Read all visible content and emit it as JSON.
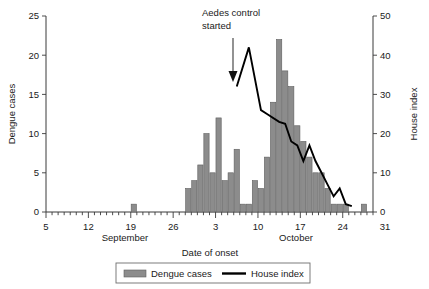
{
  "chart_data": {
    "type": "bar",
    "title": "",
    "xlabel": "Date of onset",
    "ylabel": "Dengue cases",
    "y2label": "House index",
    "ylim": [
      0,
      25
    ],
    "y2lim": [
      0,
      50
    ],
    "xlim_day_index": [
      0,
      54
    ],
    "grid": false,
    "legend_position": "bottom",
    "y_ticks": [
      "0",
      "5",
      "10",
      "15",
      "20",
      "25"
    ],
    "y_tick_values": [
      0,
      5,
      10,
      15,
      20,
      25
    ],
    "y2_ticks": [
      "0",
      "10",
      "20",
      "30",
      "40",
      "50"
    ],
    "y2_tick_values": [
      0,
      10,
      20,
      30,
      40,
      50
    ],
    "x_ticks": [
      "5",
      "12",
      "19",
      "26",
      "3",
      "10",
      "17",
      "24",
      "31"
    ],
    "x_tick_day_index": [
      0,
      7,
      14,
      21,
      28,
      35,
      42,
      49,
      56
    ],
    "month_labels": [
      {
        "text": "September",
        "day_index": 13
      },
      {
        "text": "October",
        "day_index": 41
      }
    ],
    "annotations": [
      {
        "text_line1": "Aedes control",
        "text_line2": "started",
        "arrow_day_index": 31,
        "arrow_tip_value_y2": 32
      }
    ],
    "legend": [
      {
        "label": "Dengue cases",
        "marker": "bar",
        "color": "#8c8c8c"
      },
      {
        "label": "House index",
        "marker": "line",
        "color": "#000000"
      }
    ],
    "categories_day_index": [
      0,
      1,
      2,
      3,
      4,
      5,
      6,
      7,
      8,
      9,
      10,
      11,
      12,
      13,
      14,
      15,
      16,
      17,
      18,
      19,
      20,
      21,
      22,
      23,
      24,
      25,
      26,
      27,
      28,
      29,
      30,
      31,
      32,
      33,
      34,
      35,
      36,
      37,
      38,
      39,
      40,
      41,
      42,
      43,
      44,
      45,
      46,
      47,
      48,
      49,
      50,
      51,
      52,
      53
    ],
    "date_labels": [
      "Sep 5",
      "Sep 6",
      "Sep 7",
      "Sep 8",
      "Sep 9",
      "Sep 10",
      "Sep 11",
      "Sep 12",
      "Sep 13",
      "Sep 14",
      "Sep 15",
      "Sep 16",
      "Sep 17",
      "Sep 18",
      "Sep 19",
      "Sep 20",
      "Sep 21",
      "Sep 22",
      "Sep 23",
      "Sep 24",
      "Sep 25",
      "Sep 26",
      "Sep 27",
      "Sep 28",
      "Sep 29",
      "Sep 30",
      "Oct 1",
      "Oct 2",
      "Oct 3",
      "Oct 4",
      "Oct 5",
      "Oct 6",
      "Oct 7",
      "Oct 8",
      "Oct 9",
      "Oct 10",
      "Oct 11",
      "Oct 12",
      "Oct 13",
      "Oct 14",
      "Oct 15",
      "Oct 16",
      "Oct 17",
      "Oct 18",
      "Oct 19",
      "Oct 20",
      "Oct 21",
      "Oct 22",
      "Oct 23",
      "Oct 24",
      "Oct 25",
      "Oct 26",
      "Oct 27",
      "Oct 28"
    ],
    "values": [
      0,
      0,
      0,
      0,
      0,
      0,
      0,
      0,
      0,
      0,
      0,
      0,
      0,
      0,
      1,
      0,
      0,
      0,
      0,
      0,
      0,
      0,
      0,
      3,
      4,
      6,
      10,
      5,
      12,
      4,
      5,
      8,
      1,
      1,
      4,
      3,
      7,
      14,
      22,
      18,
      16,
      11,
      9,
      7,
      5,
      5,
      3,
      1,
      1,
      1,
      0,
      0,
      1,
      0
    ],
    "series": [
      {
        "name": "Dengue cases",
        "axis": "left",
        "type": "bar",
        "values": [
          0,
          0,
          0,
          0,
          0,
          0,
          0,
          0,
          0,
          0,
          0,
          0,
          0,
          0,
          1,
          0,
          0,
          0,
          0,
          0,
          0,
          0,
          0,
          3,
          4,
          6,
          10,
          5,
          12,
          4,
          5,
          8,
          1,
          1,
          4,
          3,
          7,
          14,
          22,
          18,
          16,
          11,
          9,
          7,
          5,
          5,
          3,
          1,
          1,
          1,
          0,
          0,
          1,
          0
        ]
      },
      {
        "name": "House index",
        "axis": "right",
        "type": "line",
        "points": [
          {
            "day_index": 31,
            "value": 32
          },
          {
            "day_index": 33,
            "value": 42
          },
          {
            "day_index": 35,
            "value": 26
          },
          {
            "day_index": 36,
            "value": 25
          },
          {
            "day_index": 38,
            "value": 23
          },
          {
            "day_index": 39,
            "value": 22.5
          },
          {
            "day_index": 40,
            "value": 18
          },
          {
            "day_index": 41,
            "value": 17
          },
          {
            "day_index": 42,
            "value": 13
          },
          {
            "day_index": 43,
            "value": 17
          },
          {
            "day_index": 44,
            "value": 13
          },
          {
            "day_index": 45,
            "value": 10
          },
          {
            "day_index": 46,
            "value": 7
          },
          {
            "day_index": 47,
            "value": 4
          },
          {
            "day_index": 48,
            "value": 6
          },
          {
            "day_index": 49,
            "value": 2
          },
          {
            "day_index": 50,
            "value": 1.5
          }
        ]
      }
    ]
  }
}
